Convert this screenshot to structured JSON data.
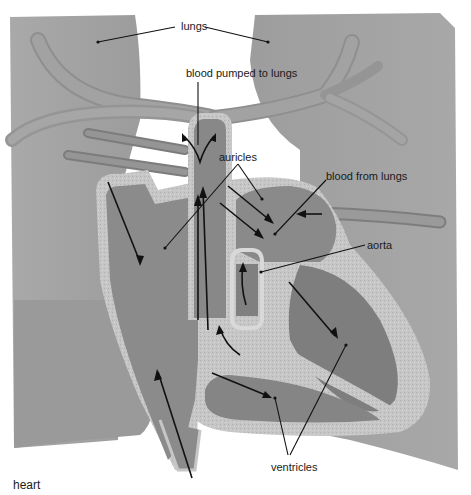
{
  "diagram": {
    "caption": "heart",
    "labels": {
      "lungs": "lungs",
      "blood_pumped": "blood pumped to lungs",
      "auricles": "auricles",
      "blood_from_lungs": "blood from lungs",
      "aorta": "aorta",
      "ventricles": "ventricles"
    },
    "colors": {
      "background": "#ffffff",
      "lung": "#a3a3a3",
      "lung_dark": "#8c8c8c",
      "vessel": "#9a9a9a",
      "vessel_edge": "#7e7e7e",
      "chamber": "#8a8a8a",
      "chamber_dark": "#7a7a7a",
      "wall": "#c4c4c4",
      "wall_edge": "#e6e6e6",
      "ink": "#111111"
    }
  }
}
